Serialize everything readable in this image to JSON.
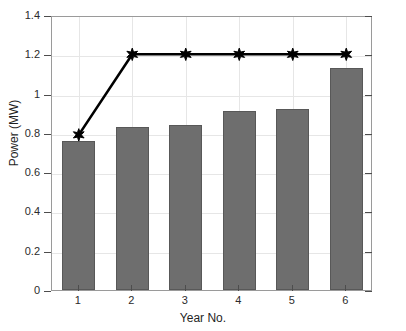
{
  "chart_data": {
    "type": "bar",
    "title": "",
    "xlabel": "Year No.",
    "ylabel": "Power (MW)",
    "categories": [
      "1",
      "2",
      "3",
      "4",
      "5",
      "6"
    ],
    "xtick_labels": [
      "1",
      "2",
      "3",
      "4",
      "5",
      "6"
    ],
    "ytick_labels": [
      "0",
      "0.2",
      "0.4",
      "0.6",
      "0.8",
      "1",
      "1.2",
      "1.4"
    ],
    "ytick_values": [
      0,
      0.2,
      0.4,
      0.6,
      0.8,
      1,
      1.2,
      1.4
    ],
    "ylim": [
      0,
      1.4
    ],
    "xlim": [
      0.5,
      6.5
    ],
    "grid": true,
    "legend": "none",
    "series": [
      {
        "name": "Power",
        "kind": "bar",
        "color": "#6e6e6e",
        "edge_color": "#585858",
        "values": [
          0.76,
          0.83,
          0.84,
          0.91,
          0.92,
          1.13
        ]
      },
      {
        "name": "Capacity",
        "kind": "line",
        "color": "#000000",
        "marker": "hexagram-star",
        "values": [
          0.8,
          1.21,
          1.21,
          1.21,
          1.21,
          1.21
        ]
      }
    ]
  },
  "axes": {
    "y_title": "Power (MW)",
    "x_title": "Year No."
  }
}
